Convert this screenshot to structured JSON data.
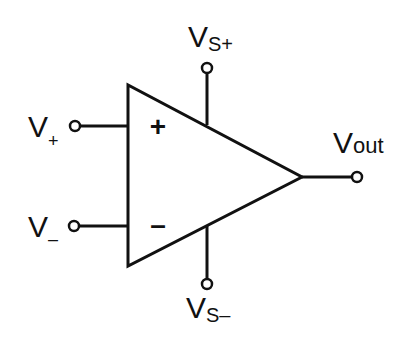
{
  "diagram": {
    "stroke_color": "#111111",
    "labels": {
      "v_plus": {
        "main": "V",
        "sub": "+"
      },
      "v_minus": {
        "main": "V",
        "sub": "–"
      },
      "vs_plus": {
        "main": "V",
        "sub": "S+"
      },
      "vs_minus": {
        "main": "V",
        "sub": "S–"
      },
      "v_out": {
        "main": "V",
        "sub": "out"
      }
    },
    "input_signs": {
      "non_inverting": "+",
      "inverting": "–"
    }
  }
}
